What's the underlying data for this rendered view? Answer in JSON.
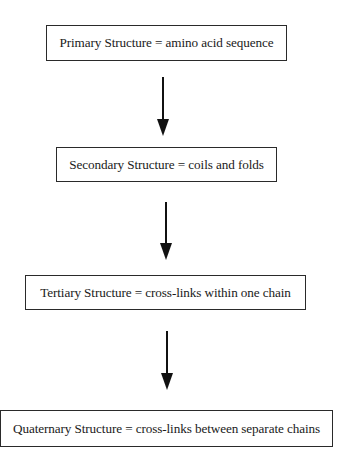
{
  "diagram": {
    "type": "flowchart",
    "direction": "top-to-bottom",
    "nodes": [
      {
        "id": "primary",
        "label": "Primary Structure = amino acid sequence"
      },
      {
        "id": "secondary",
        "label": "Secondary Structure = coils and folds"
      },
      {
        "id": "tertiary",
        "label": "Tertiary Structure = cross-links within one chain"
      },
      {
        "id": "quaternary",
        "label": "Quaternary Structure = cross-links between separate chains"
      }
    ],
    "edges": [
      {
        "from": "primary",
        "to": "secondary",
        "icon": "arrow-down-icon"
      },
      {
        "from": "secondary",
        "to": "tertiary",
        "icon": "arrow-down-icon"
      },
      {
        "from": "tertiary",
        "to": "quaternary",
        "icon": "arrow-down-icon"
      }
    ],
    "colors": {
      "border": "#2a2a2a",
      "arrow": "#111111",
      "text": "#1a1a1a",
      "background": "#ffffff"
    }
  }
}
